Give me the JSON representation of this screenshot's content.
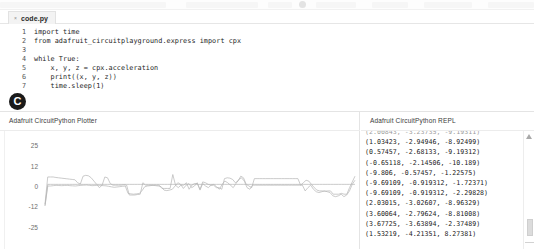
{
  "toolbar": {
    "ghost_segments": [
      {
        "left": 0,
        "width": 166
      },
      {
        "left": 186,
        "width": 72
      },
      {
        "left": 268,
        "width": 24
      },
      {
        "left": 316,
        "width": 40
      },
      {
        "left": 372,
        "width": 36
      },
      {
        "left": 424,
        "width": 48
      },
      {
        "left": 488,
        "width": 46
      }
    ]
  },
  "editor": {
    "tab": {
      "close_icon": "×",
      "label": "code.py"
    },
    "lines": [
      {
        "num": "1",
        "text": "import time"
      },
      {
        "num": "2",
        "text": "from adafruit_circuitplayground.express import cpx"
      },
      {
        "num": "3",
        "text": ""
      },
      {
        "num": "4",
        "text": "while True:"
      },
      {
        "num": "5",
        "text": "    x, y, z = cpx.acceleration"
      },
      {
        "num": "6",
        "text": "    print((x, y, z))"
      },
      {
        "num": "7",
        "text": "    time.sleep(1)"
      }
    ]
  },
  "badge": {
    "label": "C"
  },
  "plotter": {
    "title": "Adafruit CircuitPython Plotter"
  },
  "repl": {
    "title": "Adafruit CircuitPython REPL",
    "scroll_up_icon": "scroll-up-triangle",
    "lines": [
      "(2.00843, -3.23735, -9.19311)",
      "(1.03423, -2.94946, -8.92499)",
      "(0.57457, -2.68133, -9.19312)",
      "(-0.65118, -2.14506, -10.189)",
      "(-9.806, -0.57457, -1.22575)",
      "(-9.69109, -0.919312, -1.72371)",
      "(-9.69109, -0.919312, -2.29828)",
      "(2.03015, -3.02607, -8.96329)",
      "(3.60064, -2.79624, -8.81008)",
      "(3.67725, -3.63894, -2.37489)",
      "(1.53219, -4.21351, 8.27381)"
    ]
  },
  "chart_data": {
    "type": "line",
    "title": "Adafruit CircuitPython Plotter",
    "xlabel": "",
    "ylabel": "",
    "ylim": [
      -25,
      25
    ],
    "yticks": [
      25,
      12,
      0,
      -12,
      -25
    ],
    "grid": false,
    "legend": "none",
    "line_color": "#b5b5b5",
    "series": [
      {
        "name": "x",
        "values": [
          -11,
          5.5,
          5.5,
          5.5,
          5.2,
          5.0,
          4.8,
          4.6,
          4.4,
          4.2,
          4.0,
          3.8,
          2.0,
          1.2,
          6.0,
          6.5,
          6.2,
          5.0,
          3.0,
          1.0,
          -1.0,
          0.5,
          5.5,
          5.0,
          1.5,
          0.5,
          0.5,
          0.5,
          0.5,
          0.8,
          0.6,
          -5.5,
          -5.5,
          -5.5,
          -5.2,
          -5.0,
          2.0,
          0.5,
          0.5,
          0.5,
          0.5,
          0.5,
          0.5,
          -1.5,
          -1.5,
          -1.5,
          -1.5,
          7.0,
          0.5,
          -1.0,
          0.5,
          0.5,
          2.0,
          -2.0,
          0.5,
          1.5,
          1.5,
          -2.0,
          2.5,
          2.0,
          1.0,
          0.5,
          0.5,
          -1.0,
          -1.0,
          -2.0,
          4.5,
          5.0,
          4.8,
          4.0,
          2.0,
          3.0,
          6.0,
          5.0,
          1.0,
          0.0,
          -1.0,
          4.5,
          4.5,
          4.5,
          4.5,
          4.5,
          4.5,
          4.5,
          4.5,
          4.5,
          4.5,
          4.5,
          4.5,
          4.5,
          4.5,
          4.5,
          4.5,
          4.5,
          0.5,
          2.0,
          3.5,
          3.0,
          1.0,
          -1.0,
          -2.5,
          -3.0,
          -3.0,
          -3.2,
          -3.0,
          -3.0,
          -5.0,
          -5.0,
          -5.0,
          -4.5,
          -5.0,
          -5.0,
          -1.0,
          2.5,
          6.0
        ]
      },
      {
        "name": "y",
        "values": [
          -12,
          1.0,
          1.0,
          1.0,
          1.0,
          1.0,
          1.0,
          1.0,
          1.0,
          1.0,
          1.0,
          1.0,
          1.0,
          1.0,
          1.0,
          1.0,
          1.0,
          1.0,
          1.0,
          1.0,
          1.0,
          1.0,
          1.0,
          1.0,
          1.0,
          1.0,
          1.0,
          1.0,
          1.0,
          1.0,
          1.0,
          1.0,
          1.0,
          1.0,
          1.0,
          1.0,
          1.0,
          1.0,
          1.0,
          1.0,
          1.0,
          1.0,
          1.0,
          1.0,
          1.0,
          1.0,
          1.0,
          1.0,
          1.0,
          1.0,
          1.0,
          1.0,
          1.0,
          1.0,
          1.0,
          1.0,
          1.0,
          1.0,
          1.0,
          1.0,
          1.0,
          1.0,
          1.0,
          1.0,
          1.0,
          1.0,
          1.0,
          1.0,
          1.0,
          1.0,
          1.0,
          1.0,
          1.0,
          1.0,
          1.0,
          1.0,
          1.0,
          1.0,
          1.0,
          1.0,
          1.0,
          1.0,
          1.0,
          1.0,
          1.0,
          1.0,
          1.0,
          1.0,
          1.0,
          1.0,
          1.0,
          1.0,
          1.0,
          1.0,
          1.0,
          1.0,
          1.0,
          1.0,
          1.0,
          1.0,
          1.0,
          1.0,
          1.0,
          1.0,
          1.0,
          1.0,
          1.0,
          1.0,
          1.0,
          1.0,
          1.0,
          1.0,
          1.0,
          1.0,
          1.0
        ]
      },
      {
        "name": "z",
        "values": [
          -12,
          0.0,
          0.0,
          0.2,
          0.4,
          0.3,
          0.2,
          0.3,
          0.4,
          0.2,
          0.1,
          0.0,
          0.2,
          0.4,
          0.5,
          0.6,
          0.4,
          0.2,
          0.3,
          0.5,
          0.4,
          0.2,
          0.1,
          -0.2,
          -0.5,
          -0.8,
          -0.6,
          -0.4,
          -0.2,
          0.0,
          -4.5,
          -4.8,
          -5.0,
          -4.8,
          -4.6,
          -3.0,
          -0.5,
          0.0,
          0.2,
          0.4,
          0.2,
          0.0,
          -0.5,
          -2.5,
          -2.8,
          -2.5,
          -2.0,
          0.0,
          2.0,
          1.0,
          -1.5,
          0.5,
          1.5,
          -1.0,
          0.0,
          2.0,
          -2.5,
          1.5,
          0.0,
          -1.0,
          0.5,
          1.0,
          -0.5,
          -2.0,
          1.0,
          3.0,
          2.0,
          0.5,
          -1.0,
          1.5,
          4.0,
          5.0,
          3.0,
          -1.0,
          -2.0,
          0.5,
          0.5,
          0.5,
          0.5,
          0.5,
          0.5,
          0.5,
          0.5,
          0.5,
          0.5,
          0.5,
          0.5,
          0.5,
          0.5,
          0.5,
          0.5,
          0.5,
          0.5,
          0.5,
          -3.0,
          -1.0,
          0.5,
          -2.0,
          -3.5,
          -4.0,
          -3.5,
          -3.0,
          -3.5,
          -4.0,
          -6.0,
          -6.5,
          -6.0,
          -5.0,
          -6.5,
          -5.5,
          -3.0,
          1.0,
          3.5
        ]
      }
    ]
  }
}
